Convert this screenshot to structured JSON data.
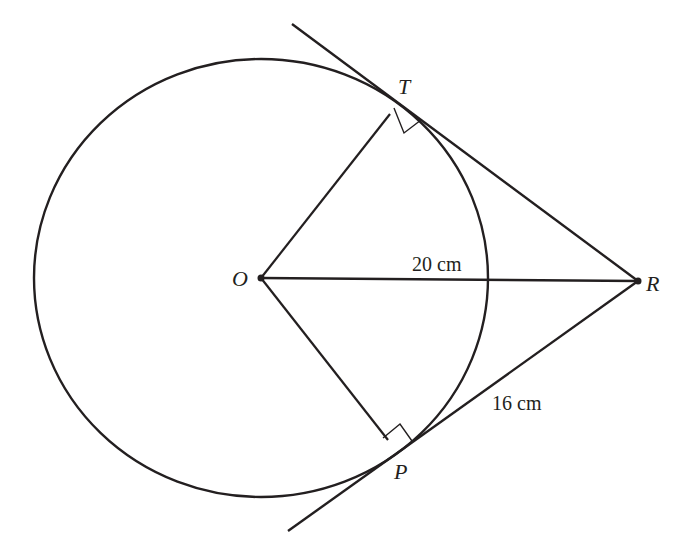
{
  "diagram": {
    "type": "geometry",
    "colors": {
      "stroke": "#231f20",
      "background": "#ffffff"
    },
    "points": {
      "O": {
        "label": "O",
        "x": 261,
        "y": 278
      },
      "T": {
        "label": "T",
        "x": 411,
        "y": 100
      },
      "P": {
        "label": "P",
        "x": 411,
        "y": 436
      },
      "R": {
        "label": "R",
        "x": 638,
        "y": 281
      }
    },
    "circle": {
      "cx": 261,
      "cy": 278,
      "rx": 227,
      "ry": 219
    },
    "measurements": {
      "OR": "20 cm",
      "PR": "16 cm"
    },
    "right_angles": [
      "OTR",
      "OPR"
    ]
  }
}
